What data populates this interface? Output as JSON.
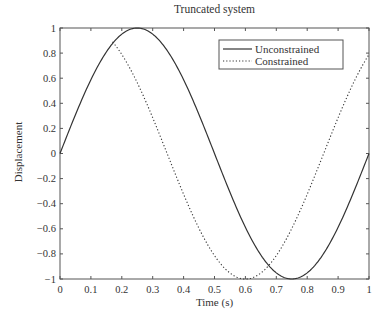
{
  "chart_data": {
    "type": "line",
    "title": "Truncated system",
    "xlabel": "Time (s)",
    "ylabel": "Displacement",
    "xlim": [
      0,
      1
    ],
    "ylim": [
      -1,
      1
    ],
    "xticks": [
      "0",
      "0.1",
      "0.2",
      "0.3",
      "0.4",
      "0.5",
      "0.6",
      "0.7",
      "0.8",
      "0.9",
      "1"
    ],
    "yticks": [
      "-1",
      "-0.8",
      "-0.6",
      "-0.4",
      "-0.2",
      "0",
      "0.2",
      "0.4",
      "0.6",
      "0.8",
      "1"
    ],
    "grid": false,
    "legend_position": "upper right",
    "series": [
      {
        "name": "Unconstrained",
        "style": "solid",
        "x": [
          0,
          0.05,
          0.1,
          0.15,
          0.2,
          0.25,
          0.3,
          0.35,
          0.4,
          0.45,
          0.5,
          0.55,
          0.6,
          0.65,
          0.7,
          0.75,
          0.8,
          0.85,
          0.9,
          0.95,
          1.0
        ],
        "values": [
          0,
          0.31,
          0.59,
          0.81,
          0.95,
          1.0,
          0.95,
          0.81,
          0.59,
          0.31,
          0,
          -0.31,
          -0.59,
          -0.81,
          -0.95,
          -1.0,
          -0.95,
          -0.81,
          -0.59,
          -0.31,
          0
        ]
      },
      {
        "name": "Constrained",
        "style": "dotted",
        "x": [
          0.17,
          0.2,
          0.25,
          0.3,
          0.35,
          0.4,
          0.45,
          0.5,
          0.55,
          0.6,
          0.65,
          0.7,
          0.75,
          0.8,
          0.85,
          0.9,
          0.95,
          1.0
        ],
        "values": [
          0.85,
          0.78,
          0.6,
          0.36,
          0.09,
          -0.19,
          -0.46,
          -0.71,
          -0.89,
          -1.0,
          -0.95,
          -0.81,
          -0.59,
          -0.31,
          0.0,
          0.31,
          0.58,
          0.82
        ]
      }
    ]
  }
}
